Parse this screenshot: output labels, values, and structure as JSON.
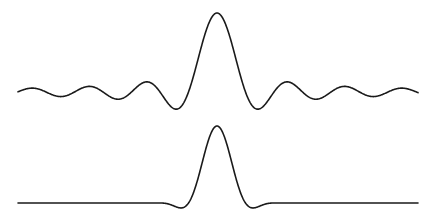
{
  "figure": {
    "stroke_color": "#1a1a1a",
    "background_color": "#ffffff"
  },
  "waveforms": [
    {
      "id": "sinc",
      "x_start": 18,
      "x_end": 418,
      "center_x": 217,
      "baseline_y": 92,
      "peak_y": 13,
      "zero_spacing_px": 28.5,
      "window_half_width_px": null
    },
    {
      "id": "windowed-sinc",
      "x_start": 18,
      "x_end": 418,
      "center_x": 217,
      "baseline_y": 203,
      "peak_y": 126,
      "zero_spacing_px": 28.5,
      "window_half_width_px": 60
    }
  ]
}
